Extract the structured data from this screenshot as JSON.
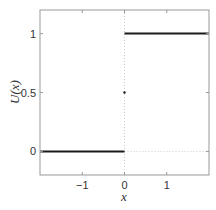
{
  "chart_data": {
    "type": "line",
    "title": "",
    "xlabel": "x",
    "ylabel": "U(x)",
    "xlim": [
      -2,
      2
    ],
    "ylim": [
      -0.2,
      1.2
    ],
    "xticks": [
      -1,
      0,
      1
    ],
    "xtick_labels": [
      "−1",
      "0",
      "1"
    ],
    "yticks": [
      0,
      0.5,
      1
    ],
    "ytick_labels": [
      "0",
      "0.5",
      "1"
    ],
    "grid": false,
    "legend": null,
    "series": [
      {
        "name": "U(x) for x<0",
        "x": [
          -2,
          0
        ],
        "y": [
          0,
          0
        ],
        "style": "solid",
        "color": "#1a1a1a"
      },
      {
        "name": "U(x) for x>0",
        "x": [
          0,
          2
        ],
        "y": [
          1,
          1
        ],
        "style": "solid",
        "color": "#1a1a1a"
      }
    ],
    "annotations": [
      {
        "type": "vline",
        "x": 0,
        "style": "dotted",
        "color": "#cccccc"
      },
      {
        "type": "hline",
        "y": 0,
        "x_from": 0,
        "x_to": 2,
        "style": "dotted",
        "color": "#cccccc"
      },
      {
        "type": "point",
        "x": 0,
        "y": 0.5,
        "marker": "dot",
        "color": "#1a1a1a"
      }
    ]
  },
  "colors": {
    "axes": "#999999",
    "line": "#1a1a1a",
    "guide": "#cccccc"
  }
}
